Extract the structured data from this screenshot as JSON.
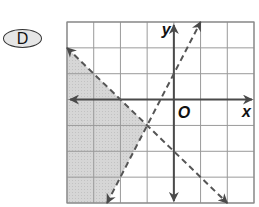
{
  "choice": {
    "label": "D"
  },
  "graph": {
    "x_range": [
      -4,
      3
    ],
    "y_range": [
      -4,
      3
    ],
    "grid_cells": 7,
    "axis_labels": {
      "x": "x",
      "y": "y",
      "origin": "O"
    },
    "lines": [
      {
        "name": "line-1",
        "equation": "y = 2x + 1",
        "style": "dashed",
        "from": [
          -2.5,
          -4
        ],
        "to": [
          1,
          3
        ]
      },
      {
        "name": "line-2",
        "equation": "y = -x - 2",
        "style": "dashed",
        "from": [
          -4,
          2
        ],
        "to": [
          2,
          -4
        ]
      }
    ],
    "intersection": [
      -1,
      -1
    ],
    "shaded_region": {
      "description": "left of both dashed lines",
      "vertices": [
        [
          -4,
          2
        ],
        [
          -1,
          -1
        ],
        [
          -2.5,
          -4
        ],
        [
          -4,
          -4
        ]
      ]
    },
    "colors": {
      "grid": "#9a9a9a",
      "axes": "#4a4a4a",
      "lines": "#555555",
      "shade": "#d3d3d3",
      "border": "#8a8a8a"
    }
  }
}
